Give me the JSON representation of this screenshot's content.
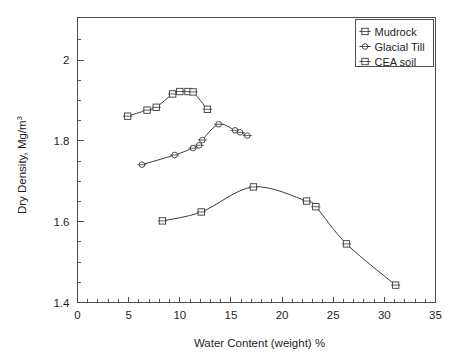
{
  "chart_data": {
    "type": "line",
    "title": "",
    "xlabel": "Water Content (weight) %",
    "ylabel": "Dry Density,  Mg/m",
    "ylabel_superscript": "3",
    "xlim": [
      0,
      35
    ],
    "ylim": [
      1.4,
      2.08
    ],
    "grid": false,
    "legend_position": "top-right",
    "x_ticks": [
      0,
      5,
      10,
      15,
      20,
      25,
      30,
      35
    ],
    "x_tick_labels": [
      "0",
      "5",
      "10",
      "15",
      "20",
      "25",
      "30",
      "35"
    ],
    "x_minor_step": 1,
    "y_ticks": [
      1.4,
      1.6,
      1.8,
      2
    ],
    "y_tick_labels": [
      "1.4",
      "1.6",
      "1.8",
      "2"
    ],
    "y_minor_step": 0.05,
    "series": [
      {
        "name": "Mudrock",
        "marker": "square-open",
        "points": [
          [
            8.3,
            1.602
          ],
          [
            12.1,
            1.624
          ],
          [
            17.2,
            1.686
          ],
          [
            22.4,
            1.651
          ],
          [
            23.3,
            1.637
          ],
          [
            26.3,
            1.545
          ],
          [
            31.1,
            1.443
          ]
        ]
      },
      {
        "name": "Glacial Till",
        "marker": "circle-open",
        "points": [
          [
            6.3,
            1.741
          ],
          [
            9.5,
            1.765
          ],
          [
            11.3,
            1.782
          ],
          [
            11.9,
            1.789
          ],
          [
            12.2,
            1.802
          ],
          [
            13.8,
            1.841
          ],
          [
            15.4,
            1.826
          ],
          [
            15.9,
            1.821
          ],
          [
            16.6,
            1.813
          ]
        ]
      },
      {
        "name": "CEA soil",
        "marker": "square-open",
        "points": [
          [
            4.9,
            1.861
          ],
          [
            6.8,
            1.876
          ],
          [
            7.7,
            1.883
          ],
          [
            9.3,
            1.916
          ],
          [
            10.0,
            1.922
          ],
          [
            10.8,
            1.922
          ],
          [
            11.3,
            1.921
          ],
          [
            12.7,
            1.878
          ]
        ]
      }
    ]
  },
  "legend": {
    "entries": [
      {
        "label": "Mudrock",
        "marker": "square-open"
      },
      {
        "label": "Glacial Till",
        "marker": "circle-open"
      },
      {
        "label": "CEA soil",
        "marker": "square-open"
      }
    ]
  },
  "colors": {
    "line": "#3b3b3b",
    "axis": "#4d4d4d",
    "text": "#1f1f1f",
    "background": "#ffffff",
    "marker_fill": "#fdfdfd"
  }
}
